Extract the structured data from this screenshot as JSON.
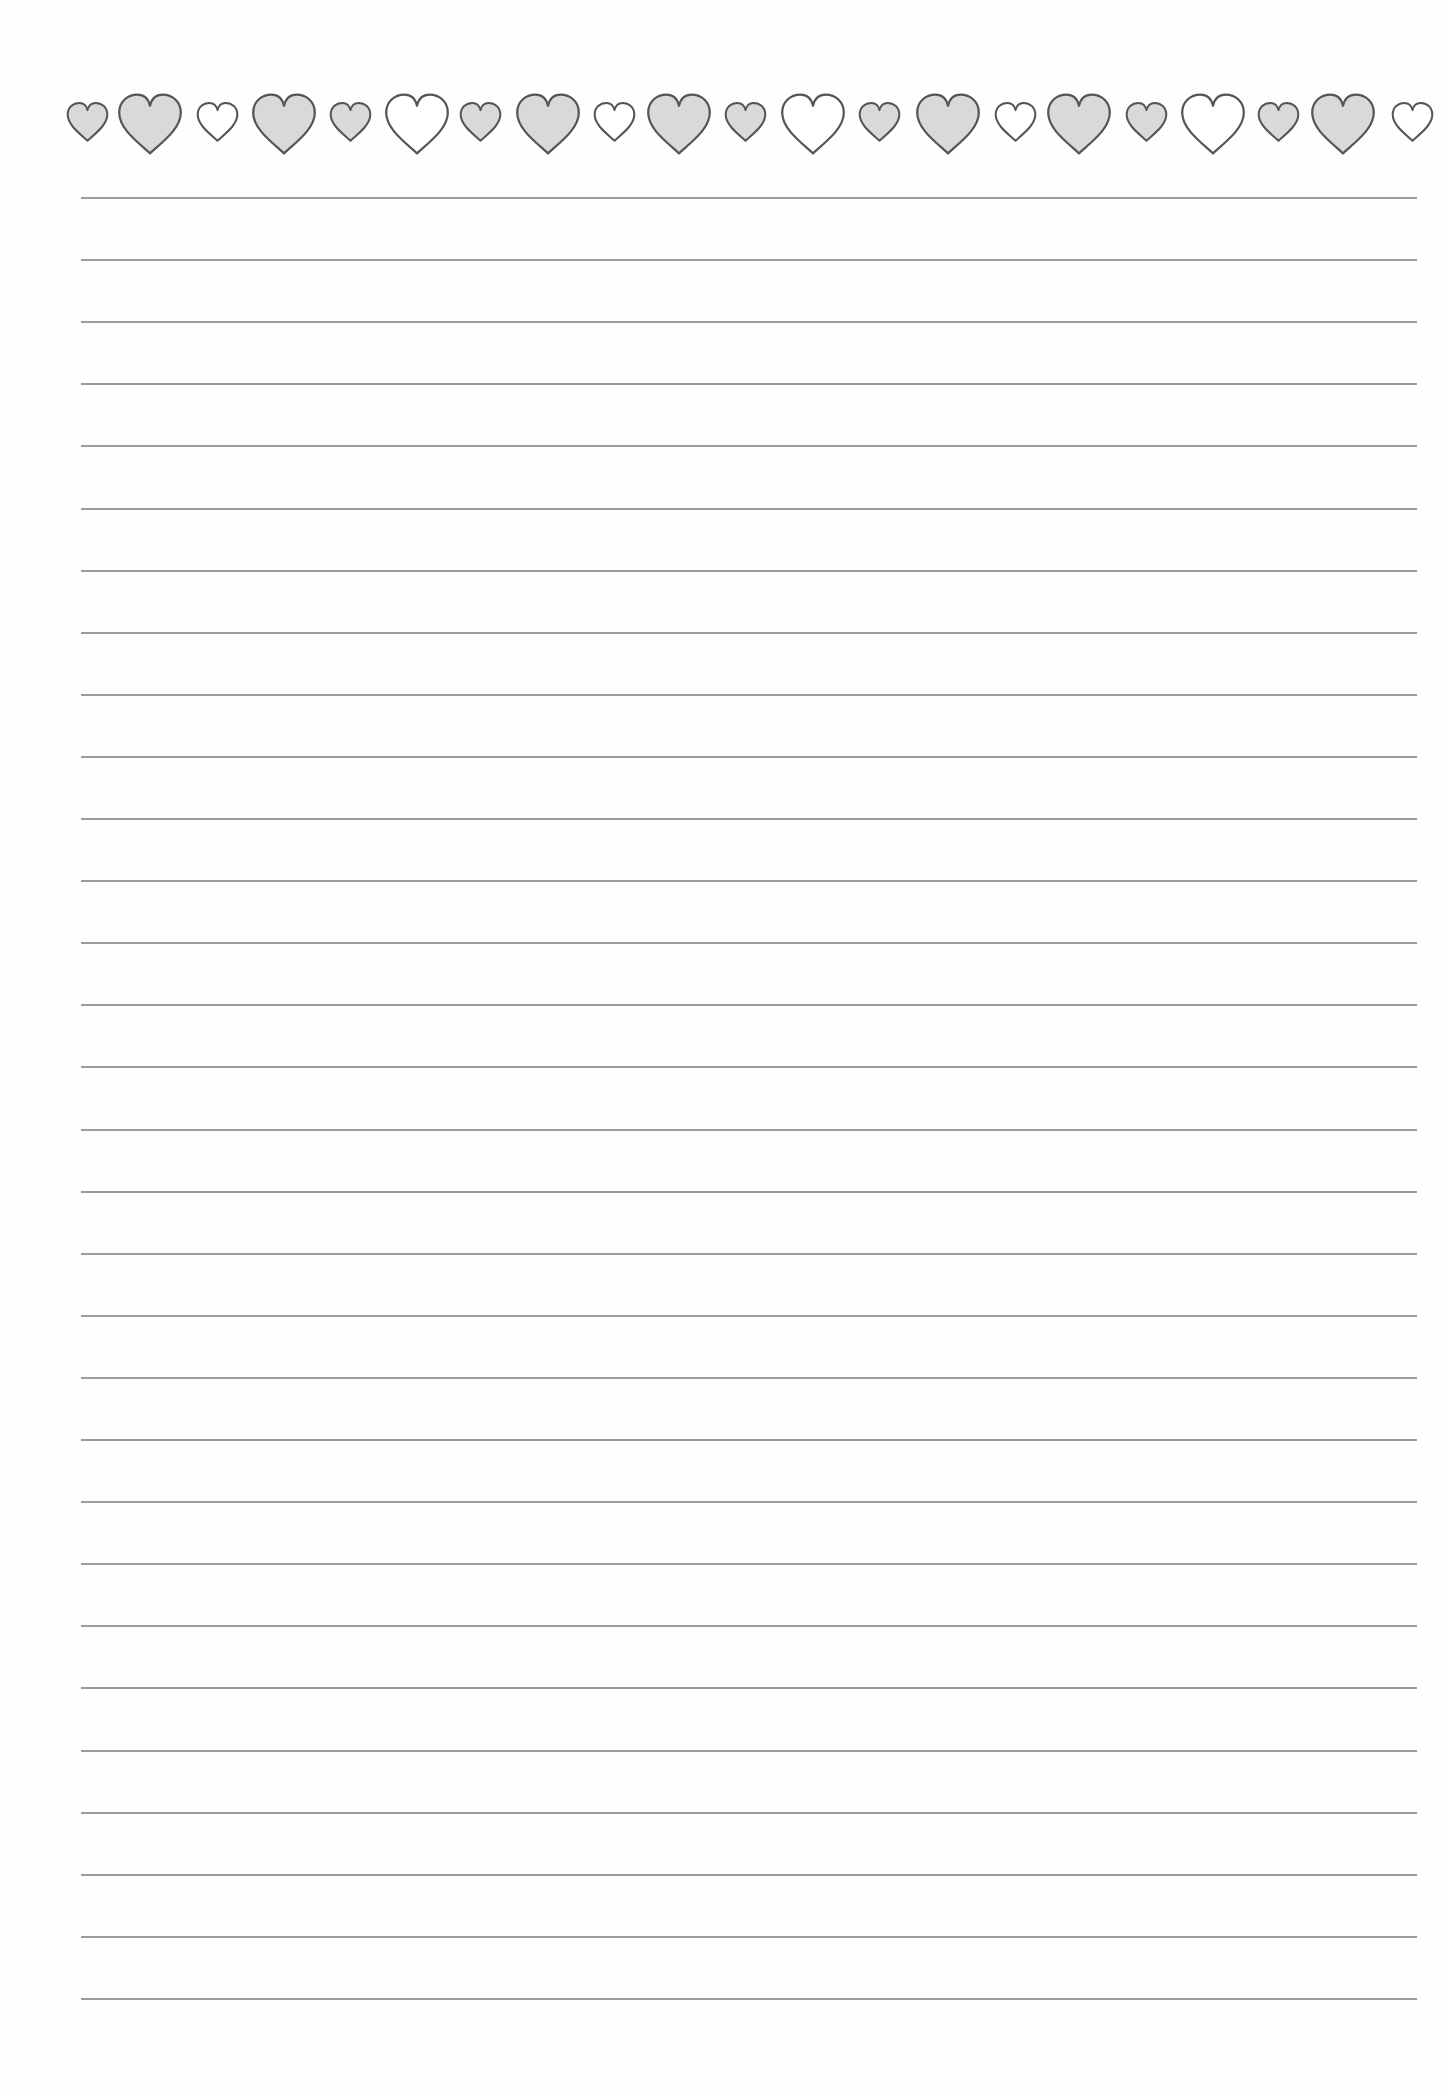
{
  "document": {
    "type": "lined-stationery",
    "background_color": "#ffffff",
    "heart_border": {
      "stroke_color": "#555555",
      "filled_color": "#d9d9d9",
      "outline_fill_color": "#ffffff",
      "hearts": [
        {
          "cx": 87,
          "size": "small",
          "filled": true
        },
        {
          "cx": 150,
          "size": "large",
          "filled": true
        },
        {
          "cx": 217,
          "size": "small",
          "filled": false
        },
        {
          "cx": 284,
          "size": "large",
          "filled": true
        },
        {
          "cx": 350,
          "size": "small",
          "filled": true
        },
        {
          "cx": 417,
          "size": "large",
          "filled": false
        },
        {
          "cx": 480,
          "size": "small",
          "filled": true
        },
        {
          "cx": 548,
          "size": "large",
          "filled": true
        },
        {
          "cx": 614,
          "size": "small",
          "filled": false
        },
        {
          "cx": 679,
          "size": "large",
          "filled": true
        },
        {
          "cx": 745,
          "size": "small",
          "filled": true
        },
        {
          "cx": 813,
          "size": "large",
          "filled": false
        },
        {
          "cx": 879,
          "size": "small",
          "filled": true
        },
        {
          "cx": 948,
          "size": "large",
          "filled": true
        },
        {
          "cx": 1015,
          "size": "small",
          "filled": false
        },
        {
          "cx": 1079,
          "size": "large",
          "filled": true
        },
        {
          "cx": 1146,
          "size": "small",
          "filled": true
        },
        {
          "cx": 1213,
          "size": "large",
          "filled": false
        },
        {
          "cx": 1278,
          "size": "small",
          "filled": true
        },
        {
          "cx": 1343,
          "size": "large",
          "filled": true
        },
        {
          "cx": 1412,
          "size": "small",
          "filled": false
        }
      ]
    },
    "ruled_lines": {
      "count": 30,
      "first_y": 197,
      "last_y": 1998,
      "x_start": 81,
      "x_end": 1417,
      "color": "#8a8a8a"
    }
  }
}
